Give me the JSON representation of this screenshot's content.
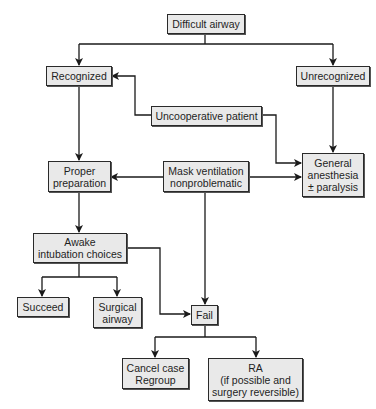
{
  "diagram": {
    "type": "flowchart",
    "colors": {
      "box_fill": "#e9e9e9",
      "box_border": "#2a2a2a",
      "line": "#1a1a1a",
      "background": "#ffffff"
    },
    "nodes": {
      "difficult_airway": "Difficult airway",
      "recognized": "Recognized",
      "unrecognized": "Unrecognized",
      "uncooperative_patient": "Uncooperative patient",
      "proper_preparation": "Proper\npreparation",
      "mask_ventilation": "Mask ventilation\nnonproblematic",
      "general_anesthesia": "General\nanesthesia\n± paralysis",
      "awake_intubation": "Awake\nintubation choices",
      "succeed": "Succeed",
      "surgical_airway": "Surgical\nairway",
      "fail": "Fail",
      "cancel_case": "Cancel case\nRegroup",
      "ra": "RA\n(if possible and\nsurgery reversible)"
    },
    "edges": [
      {
        "from": "Difficult airway",
        "to": "Recognized"
      },
      {
        "from": "Difficult airway",
        "to": "Unrecognized"
      },
      {
        "from": "Uncooperative patient",
        "to": "Recognized"
      },
      {
        "from": "Uncooperative patient",
        "to": "General anesthesia ± paralysis"
      },
      {
        "from": "Recognized",
        "to": "Proper preparation"
      },
      {
        "from": "Unrecognized",
        "to": "General anesthesia ± paralysis"
      },
      {
        "from": "Mask ventilation nonproblematic",
        "to": "Proper preparation"
      },
      {
        "from": "Mask ventilation nonproblematic",
        "to": "General anesthesia ± paralysis"
      },
      {
        "from": "Mask ventilation nonproblematic",
        "to": "Fail"
      },
      {
        "from": "Proper preparation",
        "to": "Awake intubation choices"
      },
      {
        "from": "Awake intubation choices",
        "to": "Succeed"
      },
      {
        "from": "Awake intubation choices",
        "to": "Surgical airway"
      },
      {
        "from": "Awake intubation choices",
        "to": "Fail"
      },
      {
        "from": "Fail",
        "to": "Cancel case Regroup"
      },
      {
        "from": "Fail",
        "to": "RA (if possible and surgery reversible)"
      }
    ]
  }
}
